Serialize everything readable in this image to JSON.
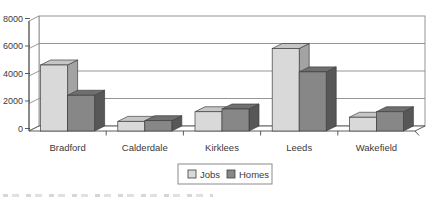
{
  "page": {
    "background": "#ffffff"
  },
  "chart_data": {
    "type": "bar",
    "variant": "3d-clustered-column",
    "title": "",
    "xlabel": "",
    "ylabel": "",
    "categories": [
      "Bradford",
      "Calderdale",
      "Kirklees",
      "Leeds",
      "Wakefield"
    ],
    "series": [
      {
        "name": "Jobs",
        "values": [
          4800,
          700,
          1400,
          6000,
          1000
        ],
        "color_front": "#d9d9d9",
        "color_top": "#c6c6c6",
        "color_side": "#a3a3a3"
      },
      {
        "name": "Homes",
        "values": [
          2600,
          750,
          1600,
          4300,
          1400
        ],
        "color_front": "#878787",
        "color_top": "#6f6f6f",
        "color_side": "#575757"
      }
    ],
    "ylim": [
      0,
      8000
    ],
    "yticks": [
      0,
      2000,
      4000,
      6000,
      8000
    ],
    "grid": true,
    "legend_position": "bottom-center",
    "colors": {
      "gridline": "#8a8a8a",
      "axis": "#4a4a4a",
      "wall": "#ffffff",
      "text": "#3a3a3a",
      "outline": "#3f3f3f",
      "legend_border": "#8a8a8a"
    }
  }
}
